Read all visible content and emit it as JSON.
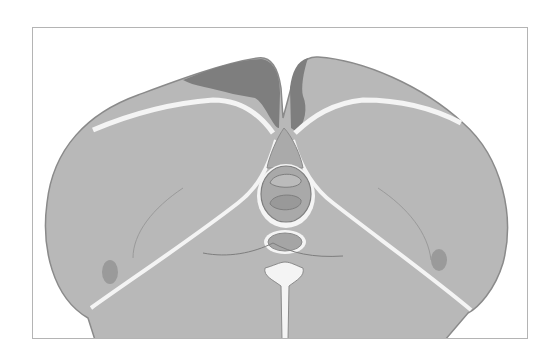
{
  "figure": {
    "colors": {
      "background": "#ffffff",
      "frame_border": "#b4b4b4",
      "muscle_fill": "#b8b8b8",
      "muscle_outline": "#8a8a8a",
      "dark_region": "#7e7e7e",
      "fascia": "#f4f4f4",
      "vertebra_fill": "#a9a9a9"
    }
  }
}
